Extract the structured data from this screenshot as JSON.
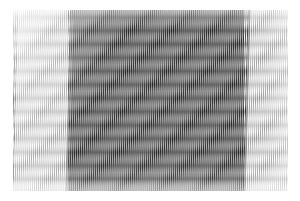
{
  "image": {
    "title": "Moire Interference Pattern",
    "kind": "scanned-line-grating",
    "width": 300,
    "height": 201,
    "background_color": "#ffffff"
  },
  "pattern": {
    "region": {
      "x": 13,
      "y": 10,
      "width": 275,
      "height": 181
    },
    "grating": {
      "period_px": 2.05,
      "slant_deg": 1.6,
      "light_color": "#ffffff",
      "mid_color": "#b9b9b9",
      "dark_color": "#4a4a4a"
    },
    "fringe": {
      "orientation": "horizontal",
      "period_px": 13.5,
      "light_color": "#ffffff",
      "dark_color": "#6e6e6e"
    }
  },
  "zones": [
    {
      "name": "left-light-band",
      "label": "Left light grating zone",
      "x": 13,
      "y": 10,
      "width": 55,
      "height": 181,
      "density": "light",
      "tone": "#cfcfcf"
    },
    {
      "name": "center-dark-band",
      "label": "Central dark moire zone",
      "x": 68,
      "y": 10,
      "width": 176,
      "height": 181,
      "density": "dark",
      "tone": "#7a7a7a"
    },
    {
      "name": "right-light-band",
      "label": "Right light grating zone",
      "x": 244,
      "y": 10,
      "width": 44,
      "height": 181,
      "density": "light",
      "tone": "#cfcfcf"
    }
  ],
  "edges": {
    "left_seam_x": 65,
    "right_seam_x": 243,
    "seam_slant_deg": 1.6,
    "seam_color": "#9a9a9a"
  },
  "chart_data": {
    "type": "heatmap",
    "xlabel": "",
    "ylabel": "",
    "x": [
      13,
      68,
      156,
      244,
      288
    ],
    "y": [
      10,
      55,
      100,
      145,
      190
    ],
    "categories": [
      "left-light-band",
      "center-dark-band",
      "right-light-band"
    ],
    "series": [
      {
        "name": "mean-luminance",
        "values": [
          207,
          124,
          201
        ]
      },
      {
        "name": "stripe-contrast",
        "values": [
          46,
          118,
          52
        ]
      },
      {
        "name": "fringe-amplitude",
        "values": [
          8,
          44,
          11
        ]
      }
    ],
    "xlim": [
      0,
      300
    ],
    "ylim": [
      0,
      201
    ],
    "grid": false,
    "legend": "none"
  }
}
